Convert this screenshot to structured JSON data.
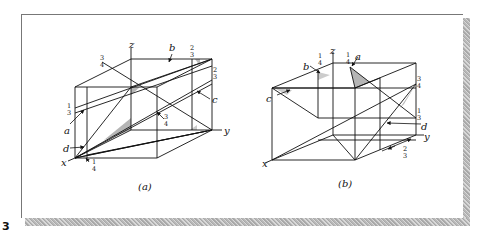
{
  "figure": {
    "id_label": "3",
    "panels": [
      {
        "caption": "(a)",
        "axes": {
          "x": "x",
          "y": "y",
          "z": "z"
        },
        "plane_labels": [
          "a",
          "b",
          "c",
          "d"
        ],
        "fractions": {
          "top_left": {
            "num": "3",
            "den": "4"
          },
          "top_right": {
            "num": "2",
            "den": "3"
          },
          "right_edge": {
            "num": "2",
            "den": "3"
          },
          "left_edge": {
            "num": "1",
            "den": "3"
          },
          "center": {
            "num": "3",
            "den": "4"
          },
          "bottom": {
            "num": "1",
            "den": "4"
          }
        }
      },
      {
        "caption": "(b)",
        "axes": {
          "x": "x",
          "y": "y",
          "z": "z"
        },
        "plane_labels": [
          "a",
          "b",
          "c",
          "d"
        ],
        "fractions": {
          "top_b": {
            "num": "1",
            "den": "4"
          },
          "top_a": {
            "num": "1",
            "den": "4"
          },
          "right_upper": {
            "num": "3",
            "den": "4"
          },
          "right_lower": {
            "num": "1",
            "den": "3"
          },
          "bottom_right": {
            "num": "2",
            "den": "3"
          }
        }
      }
    ]
  }
}
